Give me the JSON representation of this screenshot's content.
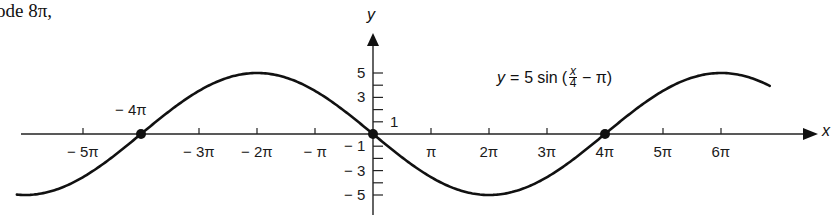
{
  "lead_text": "ode 8π,",
  "chart_data": {
    "type": "line",
    "title": "",
    "equation": {
      "lhs": "y",
      "eq": "=",
      "coef": "5",
      "func": "sin",
      "open": "(",
      "frac_num": "x",
      "frac_den": "4",
      "rest": "− π)"
    },
    "function": "y = 5 sin(x/4 - pi)",
    "amplitude": 5,
    "period": "8π",
    "phase_shift": "4π",
    "xlabel": "x",
    "ylabel": "y",
    "x_range_pi": [
      -6.14,
      6.84
    ],
    "xlim_pi": [
      -6.2,
      7.6
    ],
    "ylim": [
      -6.5,
      8.5
    ],
    "x_ticks": [
      {
        "value_pi": -5,
        "label": "− 5π"
      },
      {
        "value_pi": -4,
        "label": "− 4π"
      },
      {
        "value_pi": -3,
        "label": "− 3π"
      },
      {
        "value_pi": -2,
        "label": "− 2π"
      },
      {
        "value_pi": -1,
        "label": "− π"
      },
      {
        "value_pi": 1,
        "label": "π"
      },
      {
        "value_pi": 2,
        "label": "2π"
      },
      {
        "value_pi": 3,
        "label": "3π"
      },
      {
        "value_pi": 4,
        "label": "4π"
      },
      {
        "value_pi": 5,
        "label": "5π"
      },
      {
        "value_pi": 6,
        "label": "6π"
      }
    ],
    "y_ticks": [
      {
        "value": 5,
        "label": "5"
      },
      {
        "value": 4,
        "label": ""
      },
      {
        "value": 3,
        "label": "3"
      },
      {
        "value": 2,
        "label": ""
      },
      {
        "value": 1,
        "label": "1"
      },
      {
        "value": -1,
        "label": "− 1"
      },
      {
        "value": -2,
        "label": ""
      },
      {
        "value": -3,
        "label": "− 3"
      },
      {
        "value": -4,
        "label": ""
      },
      {
        "value": -5,
        "label": "− 5"
      }
    ],
    "marked_points": [
      {
        "x_pi": -4,
        "y": 0,
        "label": "− 4π"
      },
      {
        "x_pi": 0,
        "y": 0,
        "label": ""
      },
      {
        "x_pi": 4,
        "y": 0,
        "label": "4π"
      }
    ],
    "key_points": [
      {
        "x_pi": -6,
        "y": -5
      },
      {
        "x_pi": -4,
        "y": 0
      },
      {
        "x_pi": -2,
        "y": 5
      },
      {
        "x_pi": 0,
        "y": 0
      },
      {
        "x_pi": 2,
        "y": -5
      },
      {
        "x_pi": 4,
        "y": 0
      },
      {
        "x_pi": 6,
        "y": 5
      }
    ],
    "grid": false,
    "legend": null
  }
}
